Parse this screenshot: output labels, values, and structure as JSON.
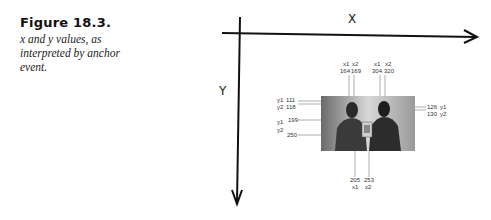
{
  "figure": {
    "title": "Figure 18.3.",
    "description": "x and y values, as interpreted by anchor event."
  },
  "axes": {
    "x_label": "X",
    "y_label": "Y"
  },
  "coordinates": {
    "top_left_pair": {
      "labels": [
        "x1",
        "x2"
      ],
      "values": [
        "164",
        "169"
      ]
    },
    "top_right_pair": {
      "labels": [
        "x1",
        "x2"
      ],
      "values": [
        "304",
        "320"
      ]
    },
    "bottom_pair": {
      "values": [
        "205",
        "253"
      ],
      "labels": [
        "x1",
        "x2"
      ]
    },
    "left": [
      {
        "label": "y1",
        "value": "111"
      },
      {
        "label": "y2",
        "value": "118"
      },
      {
        "label": "y1",
        "value": "199"
      },
      {
        "label": "y2",
        "value": "250"
      }
    ],
    "right": [
      {
        "value": "126",
        "label": "y1"
      },
      {
        "value": "130",
        "label": "y2"
      }
    ]
  },
  "photo": {
    "subject": "two-people-holding-book-photo"
  }
}
